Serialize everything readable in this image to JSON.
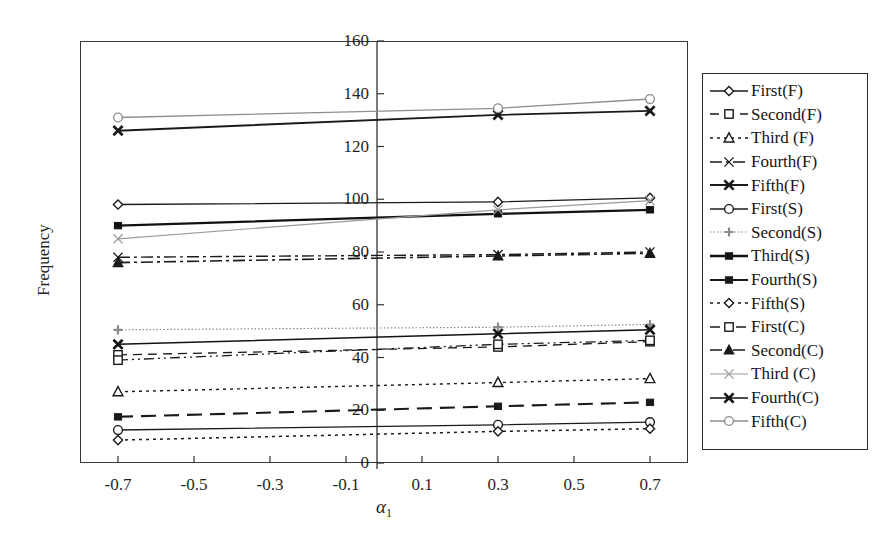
{
  "chart_data": {
    "type": "line",
    "title": "",
    "xlabel": "α₁",
    "ylabel": "Frequency",
    "x": [
      -0.7,
      0.3,
      0.7
    ],
    "xlim": [
      -0.8,
      0.8
    ],
    "ylim": [
      0,
      160
    ],
    "xticks": [
      "-0.7",
      "-0.5",
      "-0.3",
      "-0.1",
      "0.1",
      "0.3",
      "0.5",
      "0.7"
    ],
    "xtick_values": [
      -0.7,
      -0.5,
      -0.3,
      -0.1,
      0.1,
      0.3,
      0.5,
      0.7
    ],
    "yticks": [
      "0",
      "20",
      "40",
      "60",
      "80",
      "100",
      "120",
      "140",
      "160"
    ],
    "ytick_values": [
      0,
      20,
      40,
      60,
      80,
      100,
      120,
      140,
      160
    ],
    "grid": false,
    "legend_position": "right-outside",
    "series": [
      {
        "name": "First(F)",
        "values": [
          98.0,
          99.0,
          100.5
        ],
        "color": "#1a1a1a",
        "dash": "solid",
        "marker": "diamond-open",
        "width": 1.3
      },
      {
        "name": "Second(F)",
        "values": [
          41.0,
          44.0,
          46.0
        ],
        "color": "#1a1a1a",
        "dash": "dash",
        "marker": "square-open",
        "width": 1.3
      },
      {
        "name": "Third (F)",
        "values": [
          27.0,
          30.5,
          32.0
        ],
        "color": "#1a1a1a",
        "dash": "dot",
        "marker": "triangle-open",
        "width": 1.4
      },
      {
        "name": "Fourth(F)",
        "values": [
          78.0,
          79.0,
          80.0
        ],
        "color": "#1a1a1a",
        "dash": "dashdot",
        "marker": "x-thin",
        "width": 1.4
      },
      {
        "name": "Fifth(F)",
        "values": [
          126.0,
          132.0,
          133.5
        ],
        "color": "#1a1a1a",
        "dash": "solid",
        "marker": "x-bold",
        "width": 1.9
      },
      {
        "name": "First(S)",
        "values": [
          12.5,
          14.5,
          15.5
        ],
        "color": "#1a1a1a",
        "dash": "solid",
        "marker": "circle-open",
        "width": 1.3
      },
      {
        "name": "Second(S)",
        "values": [
          50.5,
          51.5,
          52.5
        ],
        "color": "#8a8a8a",
        "dash": "finedot",
        "marker": "plus",
        "width": 1.2
      },
      {
        "name": "Third(S)",
        "values": [
          90.0,
          94.5,
          96.0
        ],
        "color": "#121212",
        "dash": "solid",
        "marker": "square-solid",
        "width": 2.3
      },
      {
        "name": "Fourth(S)",
        "values": [
          17.5,
          21.5,
          23.0
        ],
        "color": "#1a1a1a",
        "dash": "longdash",
        "marker": "square-solid",
        "width": 2.1
      },
      {
        "name": "Fifth(S)",
        "values": [
          8.7,
          12.0,
          13.0
        ],
        "color": "#1a1a1a",
        "dash": "dot",
        "marker": "diamond-open",
        "width": 1.5
      },
      {
        "name": "First(C)",
        "values": [
          39.0,
          45.0,
          46.5
        ],
        "color": "#1a1a1a",
        "dash": "dashdotdot",
        "marker": "square-open",
        "width": 1.3
      },
      {
        "name": "Second(C)",
        "values": [
          76.0,
          78.5,
          79.5
        ],
        "color": "#1a1a1a",
        "dash": "dashdot",
        "marker": "triangle-solid",
        "width": 1.6
      },
      {
        "name": "Third (C)",
        "values": [
          85.0,
          96.0,
          99.5
        ],
        "color": "#9a9a9a",
        "dash": "solid",
        "marker": "x-thin",
        "width": 1.2
      },
      {
        "name": "Fourth(C)",
        "values": [
          45.0,
          49.0,
          50.5
        ],
        "color": "#121212",
        "dash": "solid",
        "marker": "x-bold",
        "width": 1.6
      },
      {
        "name": "Fifth(C)",
        "values": [
          131.0,
          134.5,
          138.0
        ],
        "color": "#8e8e8e",
        "dash": "solid",
        "marker": "circle-open",
        "width": 1.3
      }
    ]
  },
  "legend": {
    "entries": [
      "First(F)",
      "Second(F)",
      "Third (F)",
      "Fourth(F)",
      "Fifth(F)",
      "First(S)",
      "Second(S)",
      "Third(S)",
      "Fourth(S)",
      "Fifth(S)",
      "First(C)",
      "Second(C)",
      "Third (C)",
      "Fourth(C)",
      "Fifth(C)"
    ]
  },
  "axes": {
    "ylabel": "Frequency",
    "xlabel_main": "α",
    "xlabel_sub": "1"
  }
}
